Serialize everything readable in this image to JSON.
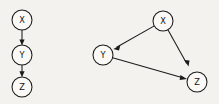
{
  "figure": {
    "background_color": "#f3f2ee",
    "stroke_color": "#1a1a1a",
    "node_fill_color": "#faf9f6",
    "node_radius": 10,
    "width": 219,
    "height": 104
  },
  "graphs": [
    {
      "id": "left-graph",
      "name": "chain-dag",
      "nodes": [
        {
          "id": "X",
          "label": "X",
          "cx": 22,
          "cy": 20
        },
        {
          "id": "Y",
          "label": "Y",
          "cx": 22,
          "cy": 55
        },
        {
          "id": "Z",
          "label": "Z",
          "cx": 22,
          "cy": 87
        }
      ],
      "edges": [
        {
          "from": "X",
          "to": "Y",
          "directed": true
        },
        {
          "from": "Y",
          "to": "Z",
          "directed": true
        }
      ]
    },
    {
      "id": "right-graph",
      "name": "triangle-dag",
      "nodes": [
        {
          "id": "X",
          "label": "X",
          "cx": 163,
          "cy": 21
        },
        {
          "id": "Y",
          "label": "Y",
          "cx": 103,
          "cy": 55
        },
        {
          "id": "Z",
          "label": "Z",
          "cx": 197,
          "cy": 82
        }
      ],
      "edges": [
        {
          "from": "X",
          "to": "Y",
          "directed": true
        },
        {
          "from": "X",
          "to": "Z",
          "directed": true
        },
        {
          "from": "Y",
          "to": "Z",
          "directed": true
        }
      ]
    }
  ],
  "labels": {
    "left_x": "X",
    "left_y": "Y",
    "left_z": "Z",
    "right_x": "X",
    "right_y": "Y",
    "right_z": "Z"
  }
}
